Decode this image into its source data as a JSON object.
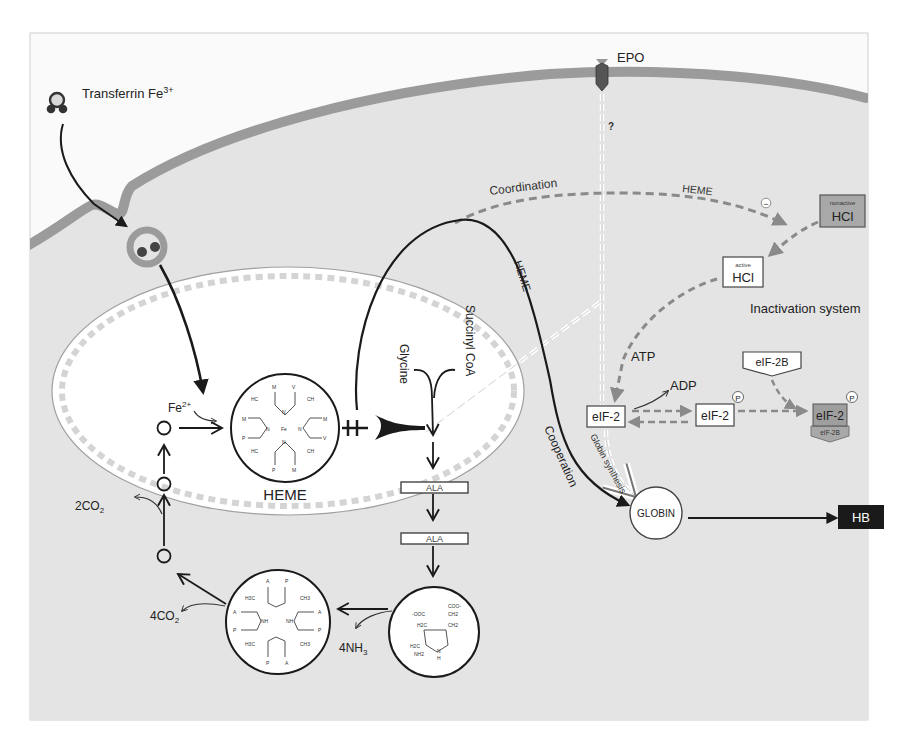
{
  "figure": {
    "colors": {
      "page_bg": "#ffffff",
      "frame_bg": "#fafafa",
      "cytoplasm": "#e4e4e4",
      "membrane": "#9b9b9b",
      "mitochondrion": "#ffffff",
      "mito_crista": "#d8d8d8",
      "dashed_arrow": "#8a8a8a",
      "black": "#1a1a1a",
      "nonactive_box": "#a8a8a8",
      "eif2_inactive_box": "#a8a8a8",
      "hb_box": "#1a1a1a"
    }
  },
  "labels": {
    "transferrin": "Transferrin Fe",
    "transferrin_sup": "3+",
    "epo": "EPO",
    "question": "?",
    "coordination": "Coordination",
    "heme_dashed": "HEME",
    "heme_curve": "HEME",
    "cooperation": "Cooperation",
    "globin_synthesis": "Globin synthesis",
    "succinyl_coa": "Succinyl CoA",
    "glycine": "Glycine",
    "fe2": "Fe",
    "fe2_sup": "2+",
    "heme_label": "HEME",
    "ala_1": "ALA",
    "ala_2": "ALA",
    "co2_2": "2CO",
    "co2_2_sub": "2",
    "co2_4": "4CO",
    "co2_4_sub": "2",
    "nh3_4": "4NH",
    "nh3_4_sub": "3",
    "globin": "GLOBIN",
    "hb": "HB",
    "minus": "−"
  },
  "inactivation": {
    "title": "Inactivation system",
    "nonactive_small": "nonactive",
    "nonactive_big": "HCl",
    "active_small": "active",
    "active_big": "HCl",
    "atp": "ATP",
    "adp": "ADP",
    "eif2_a": "eIF-2",
    "eif2_b": "eIF-2",
    "eif2_c": "eIF-2",
    "eif2b_top": "eIF-2B",
    "eif2b_bottom": "eIF-2B",
    "phospho_1": "P",
    "phospho_2": "P"
  },
  "heme_structure": {
    "atoms": [
      "M",
      "V",
      "HC",
      "CH",
      "M",
      "P",
      "N",
      "Fe",
      "N",
      "N",
      "N",
      "M",
      "V",
      "HC",
      "CH",
      "P",
      "M"
    ]
  },
  "porphyrinogen_structure": {
    "atoms": [
      "A",
      "P",
      "H3C",
      "CH3",
      "A",
      "P",
      "NH",
      "NH",
      "A",
      "P",
      "H3C",
      "CH3",
      "P",
      "A"
    ]
  },
  "porphobilinogen_structure": {
    "atoms": [
      "COO-",
      "-OOC",
      "CH2",
      "H2C",
      "CH2",
      "H2C",
      "NH2",
      "N",
      "H"
    ]
  }
}
